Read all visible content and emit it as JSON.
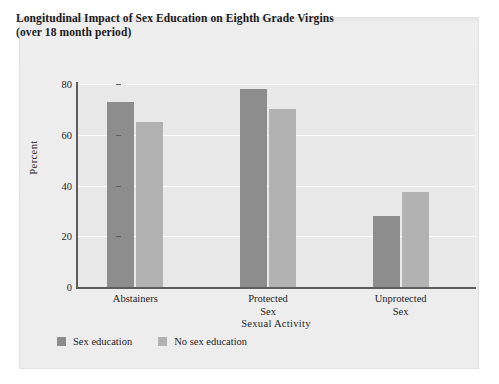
{
  "chart_data": {
    "type": "bar",
    "title": "Longitudinal Impact of Sex Education on Eighth Grade Virgins",
    "subtitle": "(over 18 month period)",
    "xlabel": "Sexual Activity",
    "ylabel": "Percent",
    "categories": [
      "Abstainers",
      "Protected Sex",
      "Unprotected Sex"
    ],
    "category_lines": [
      [
        "Abstainers"
      ],
      [
        "Protected",
        "Sex"
      ],
      [
        "Unprotected",
        "Sex"
      ]
    ],
    "series": [
      {
        "name": "Sex education",
        "color": "#8d8d8d",
        "values": [
          73,
          78,
          28
        ]
      },
      {
        "name": "No sex education",
        "color": "#b2b2b2",
        "values": [
          65,
          70,
          37.5
        ]
      }
    ],
    "ylim": [
      0,
      80
    ],
    "yticks": [
      0,
      20,
      40,
      60,
      80
    ],
    "ytick_labels": [
      "0",
      "20",
      "40",
      "60",
      "80"
    ],
    "grid": "horizontal-white",
    "legend_position": "bottom-left",
    "plot_background": "#e9e9ea",
    "page_background": "#ededee"
  }
}
